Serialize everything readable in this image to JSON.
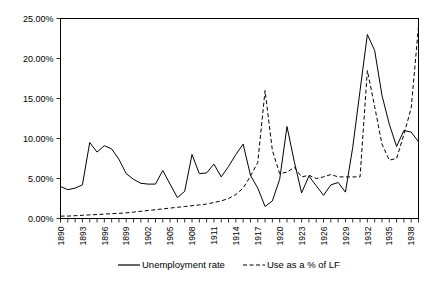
{
  "chart_data": {
    "type": "line",
    "title": "",
    "xlabel": "",
    "ylabel": "",
    "ylim": [
      0,
      25
    ],
    "ytick_labels": [
      "0.00%",
      "5.00%",
      "10.00%",
      "15.00%",
      "20.00%",
      "25.00%"
    ],
    "ytick_values": [
      0,
      5,
      10,
      15,
      20,
      25
    ],
    "grid": false,
    "legend_position": "bottom",
    "x": [
      1890,
      1891,
      1892,
      1893,
      1894,
      1895,
      1896,
      1897,
      1898,
      1899,
      1900,
      1901,
      1902,
      1903,
      1904,
      1905,
      1906,
      1907,
      1908,
      1909,
      1910,
      1911,
      1912,
      1913,
      1914,
      1915,
      1916,
      1917,
      1918,
      1919,
      1920,
      1921,
      1922,
      1923,
      1924,
      1925,
      1926,
      1927,
      1928,
      1929,
      1930,
      1931,
      1932,
      1933,
      1934,
      1935,
      1936,
      1937,
      1938,
      1939
    ],
    "xtick_labels": [
      "1890",
      "1893",
      "1896",
      "1899",
      "1902",
      "1905",
      "1908",
      "1911",
      "1914",
      "1917",
      "1920",
      "1923",
      "1926",
      "1929",
      "1932",
      "1935",
      "1938"
    ],
    "xtick_values": [
      1890,
      1893,
      1896,
      1899,
      1902,
      1905,
      1908,
      1911,
      1914,
      1917,
      1920,
      1923,
      1926,
      1929,
      1932,
      1935,
      1938
    ],
    "series": [
      {
        "name": "Unemployment rate",
        "style": "solid",
        "values": [
          4.0,
          3.6,
          3.8,
          4.2,
          9.5,
          8.3,
          9.1,
          8.7,
          7.4,
          5.6,
          4.9,
          4.4,
          4.3,
          4.3,
          6.0,
          4.3,
          2.6,
          3.4,
          8.0,
          5.6,
          5.7,
          6.8,
          5.2,
          6.5,
          8.0,
          9.3,
          5.4,
          3.8,
          1.5,
          2.2,
          4.9,
          11.5,
          7.1,
          3.2,
          5.3,
          4.1,
          2.9,
          4.2,
          4.5,
          3.3,
          8.9,
          16.0,
          23.0,
          21.0,
          15.4,
          11.8,
          9.0,
          11.0,
          10.8,
          9.6
        ]
      },
      {
        "name": "Use as a % of LF",
        "style": "dashed",
        "values": [
          0.3,
          0.3,
          0.35,
          0.4,
          0.45,
          0.5,
          0.55,
          0.6,
          0.65,
          0.7,
          0.8,
          0.9,
          1.0,
          1.1,
          1.2,
          1.3,
          1.4,
          1.5,
          1.6,
          1.7,
          1.8,
          2.0,
          2.2,
          2.5,
          3.0,
          3.8,
          5.3,
          7.0,
          16.0,
          8.5,
          5.6,
          5.8,
          6.4,
          5.2,
          5.4,
          5.0,
          5.2,
          5.5,
          5.2,
          5.2,
          5.2,
          5.2,
          18.5,
          14.0,
          9.3,
          7.3,
          7.5,
          10.5,
          13.8,
          24.0
        ]
      }
    ]
  },
  "legend": {
    "items": [
      {
        "label": "Unemployment rate",
        "style": "solid"
      },
      {
        "label": "Use as a % of LF",
        "style": "dashed"
      }
    ]
  }
}
